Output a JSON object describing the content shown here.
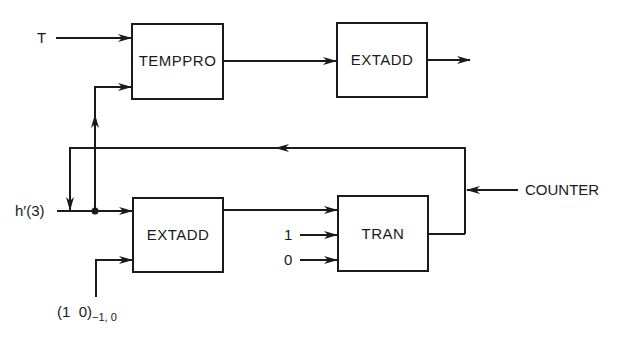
{
  "diagram": {
    "type": "block-diagram",
    "blocks": [
      {
        "id": "temppro",
        "label": "TEMPPRO"
      },
      {
        "id": "extadd_top",
        "label": "EXTADD"
      },
      {
        "id": "extadd_bottom",
        "label": "EXTADD"
      },
      {
        "id": "tran",
        "label": "TRAN"
      }
    ],
    "inputs": {
      "t": "T",
      "h": "h′(3)",
      "one": "1",
      "zero": "0",
      "counter": "COUNTER",
      "pair_main": "(1  0)",
      "pair_sub": "−1, 0"
    },
    "edges": [
      {
        "from": "T",
        "to": "temppro"
      },
      {
        "from": "h′(3)",
        "to": "temppro"
      },
      {
        "from": "temppro",
        "to": "extadd_top"
      },
      {
        "from": "extadd_top",
        "to": "output"
      },
      {
        "from": "h′(3)",
        "to": "extadd_bottom"
      },
      {
        "from": "(1 0)−1,0",
        "to": "extadd_bottom"
      },
      {
        "from": "extadd_bottom",
        "to": "tran"
      },
      {
        "from": "1",
        "to": "tran"
      },
      {
        "from": "0",
        "to": "tran"
      },
      {
        "from": "tran",
        "to": "h′(3) (feedback)"
      },
      {
        "from": "COUNTER",
        "to": "feedback line"
      }
    ]
  }
}
